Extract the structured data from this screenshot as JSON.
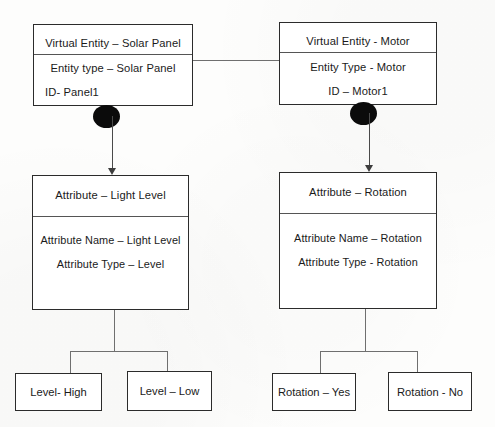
{
  "diagram": {
    "nodes": {
      "entity_solar": {
        "header": "Virtual Entity – Solar Panel",
        "type_line": "Entity type – Solar Panel",
        "id_line": "ID- Panel1"
      },
      "entity_motor": {
        "header": "Virtual Entity - Motor",
        "type_line": "Entity Type - Motor",
        "id_line": "ID – Motor1"
      },
      "attribute_light": {
        "header": "Attribute – Light Level",
        "name_line": "Attribute Name – Light Level",
        "type_line": "Attribute Type – Level"
      },
      "attribute_rotation": {
        "header": "Attribute – Rotation",
        "name_line": "Attribute Name – Rotation",
        "type_line": "Attribute Type - Rotation"
      },
      "value_level_high": {
        "label": "Level- High"
      },
      "value_level_low": {
        "label": "Level – Low"
      },
      "value_rotation_yes": {
        "label": "Rotation – Yes"
      },
      "value_rotation_no": {
        "label": "Rotation - No"
      }
    },
    "colors": {
      "node_border": "#2b2b2b",
      "divider": "#555555",
      "connector": "#6f6f6f",
      "bullet": "#0b0b0b",
      "background": "#fdfdfc",
      "text": "#1a1a1a"
    }
  }
}
